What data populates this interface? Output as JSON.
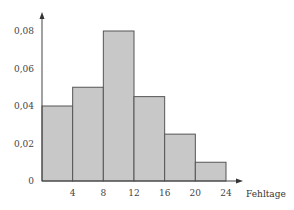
{
  "chart_data": {
    "type": "bar",
    "subtype": "histogram",
    "title": "",
    "xlabel": "Fehltage",
    "ylabel": "",
    "bins": [
      {
        "from": 0,
        "to": 4,
        "value": 0.04
      },
      {
        "from": 4,
        "to": 8,
        "value": 0.05
      },
      {
        "from": 8,
        "to": 12,
        "value": 0.08
      },
      {
        "from": 12,
        "to": 16,
        "value": 0.045
      },
      {
        "from": 16,
        "to": 20,
        "value": 0.025
      },
      {
        "from": 20,
        "to": 24,
        "value": 0.01
      }
    ],
    "categories": [
      "0-4",
      "4-8",
      "8-12",
      "12-16",
      "16-20",
      "20-24"
    ],
    "values": [
      0.04,
      0.05,
      0.08,
      0.045,
      0.025,
      0.01
    ],
    "x_ticks": [
      "4",
      "8",
      "12",
      "16",
      "20",
      "24"
    ],
    "y_ticks": [
      "0",
      "0,02",
      "0,04",
      "0,06",
      "0,08"
    ],
    "y_tick_values": [
      0,
      0.02,
      0.04,
      0.06,
      0.08
    ],
    "xlim": [
      0,
      24
    ],
    "ylim": [
      0,
      0.08
    ],
    "grid": false,
    "legend": null,
    "colors": {
      "bar_fill": "#c8c8c8",
      "bar_stroke": "#555555",
      "axis": "#444444"
    }
  }
}
